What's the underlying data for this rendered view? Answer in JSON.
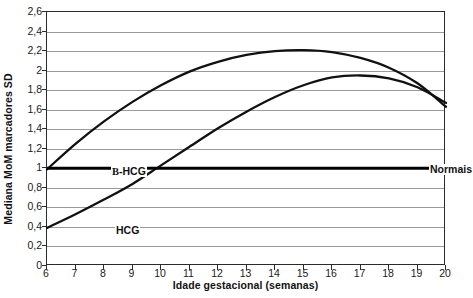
{
  "chart_data": {
    "type": "line",
    "title": "",
    "xlabel": "Idade gestacional (semanas)",
    "ylabel": "Mediana MoM marcadores SD",
    "xlim": [
      6,
      20
    ],
    "ylim": [
      0,
      2.6
    ],
    "grid": "horizontal",
    "legend_position": "inline-annotations",
    "decimal_separator": ",",
    "xticks": [
      "6",
      "7",
      "8",
      "9",
      "10",
      "11",
      "12",
      "13",
      "14",
      "15",
      "16",
      "17",
      "18",
      "19",
      "20"
    ],
    "xtick_values": [
      6,
      7,
      8,
      9,
      10,
      11,
      12,
      13,
      14,
      15,
      16,
      17,
      18,
      19,
      20
    ],
    "yticks": [
      "0",
      "0,2",
      "0,4",
      "0,6",
      "0,8",
      "1",
      "1,2",
      "1,4",
      "1,6",
      "1,8",
      "2",
      "2,2",
      "2,4",
      "2,6"
    ],
    "ytick_values": [
      0,
      0.2,
      0.4,
      0.6,
      0.8,
      1,
      1.2,
      1.4,
      1.6,
      1.8,
      2,
      2.2,
      2.4,
      2.6
    ],
    "x": [
      6,
      7,
      8,
      9,
      10,
      11,
      12,
      13,
      14,
      15,
      16,
      17,
      18,
      19,
      20
    ],
    "series": [
      {
        "name": "B-HCG",
        "label_html": "<span class=\"greekb\">B</span>-HCG",
        "color": "#111111",
        "style": "curve",
        "peak_x": 14.7,
        "peak_y": 2.21,
        "values": [
          0.99,
          1.25,
          1.48,
          1.68,
          1.85,
          1.99,
          2.09,
          2.16,
          2.2,
          2.21,
          2.19,
          2.13,
          2.03,
          1.87,
          1.63
        ]
      },
      {
        "name": "HCG",
        "label_html": "HCG",
        "color": "#111111",
        "style": "curve",
        "peak_x": 16.4,
        "peak_y": 1.95,
        "values": [
          0.39,
          0.53,
          0.68,
          0.84,
          1.03,
          1.22,
          1.41,
          1.58,
          1.73,
          1.85,
          1.93,
          1.95,
          1.92,
          1.83,
          1.67
        ]
      },
      {
        "name": "Normais",
        "label_html": "Normais",
        "color": "#000000",
        "style": "reference-line",
        "constant": 1.0,
        "values": [
          1,
          1,
          1,
          1,
          1,
          1,
          1,
          1,
          1,
          1,
          1,
          1,
          1,
          1,
          1
        ]
      }
    ],
    "annotations": [
      {
        "text": "B-HCG",
        "x": 6.8,
        "y": 1.12
      },
      {
        "text": "HCG",
        "x": 7.0,
        "y": 0.5
      },
      {
        "text": "Normais",
        "x": 18.9,
        "y": 1.1
      }
    ]
  }
}
